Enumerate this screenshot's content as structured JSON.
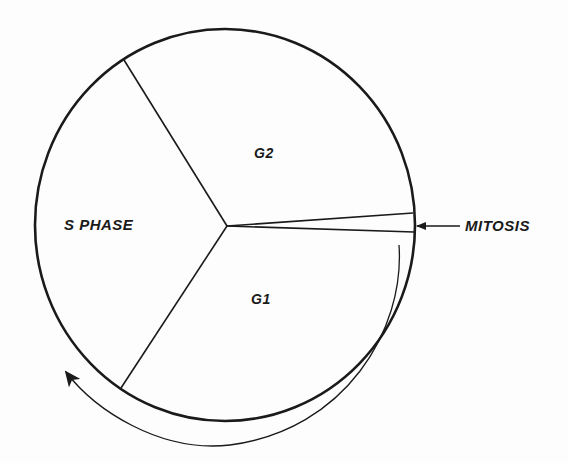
{
  "diagram": {
    "type": "cell-cycle-pie",
    "phases": [
      {
        "id": "s_phase",
        "label": "S PHASE"
      },
      {
        "id": "g2",
        "label": "G2"
      },
      {
        "id": "mitosis",
        "label": "MITOSIS"
      },
      {
        "id": "g1",
        "label": "G1"
      }
    ],
    "labels": {
      "s_phase": "S PHASE",
      "g2": "G2",
      "g1": "G1",
      "mitosis": "MITOSIS"
    },
    "direction": "clockwise",
    "colors": {
      "stroke": "#1a1a1a",
      "background": "#fdfdfd"
    }
  }
}
